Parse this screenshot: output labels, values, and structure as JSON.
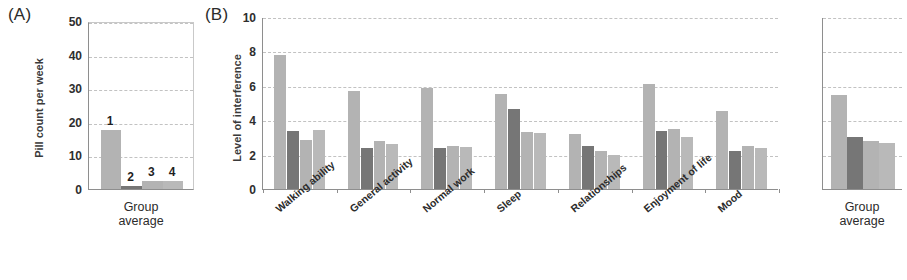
{
  "figure": {
    "panel_a_tag": "(A)",
    "panel_b_tag": "(B)"
  },
  "chart_data": [
    {
      "id": "panel_a",
      "type": "bar",
      "title": "(A)",
      "xlabel": "",
      "ylabel": "Pill count per week",
      "ylim": [
        0,
        50
      ],
      "yticks": [
        0,
        10,
        20,
        30,
        40,
        50
      ],
      "grid": true,
      "legend": "none",
      "categories": [
        "Group average"
      ],
      "bar_labels": [
        "1",
        "2",
        "3",
        "4"
      ],
      "series": [
        {
          "name": "1",
          "values": [
            17.5
          ],
          "color": "#b3b3b3"
        },
        {
          "name": "2",
          "values": [
            0.8
          ],
          "color": "#767676"
        },
        {
          "name": "3",
          "values": [
            2.3
          ],
          "color": "#b3b3b3"
        },
        {
          "name": "4",
          "values": [
            2.4
          ],
          "color": "#b9b9b9"
        }
      ]
    },
    {
      "id": "panel_b_main",
      "type": "bar",
      "title": "(B)",
      "xlabel": "",
      "ylabel": "Level of interference",
      "ylim": [
        0,
        10
      ],
      "yticks": [
        0,
        2,
        4,
        6,
        8,
        10
      ],
      "grid": true,
      "legend": "none",
      "categories": [
        "Walking ability",
        "General activity",
        "Normal work",
        "Sleep",
        "Relationships",
        "Enjoyment of life",
        "Mood"
      ],
      "series": [
        {
          "name": "1",
          "values": [
            7.8,
            5.7,
            5.85,
            5.5,
            3.2,
            6.1,
            4.55
          ],
          "color": "#b3b3b3"
        },
        {
          "name": "2",
          "values": [
            3.4,
            2.4,
            2.4,
            4.65,
            2.5,
            3.4,
            2.2
          ],
          "color": "#767676"
        },
        {
          "name": "3",
          "values": [
            2.85,
            2.8,
            2.5,
            3.3,
            2.2,
            3.5,
            2.5
          ],
          "color": "#b3b3b3"
        },
        {
          "name": "4",
          "values": [
            3.45,
            2.6,
            2.45,
            3.25,
            2.0,
            3.0,
            2.4
          ],
          "color": "#b9b9b9"
        }
      ]
    },
    {
      "id": "panel_b_group_average",
      "type": "bar",
      "title": "",
      "xlabel": "",
      "ylabel": "",
      "ylim": [
        0,
        10
      ],
      "yticks": [
        0,
        2,
        4,
        6,
        8,
        10
      ],
      "grid": true,
      "legend": "none",
      "categories": [
        "Group average"
      ],
      "series": [
        {
          "name": "1",
          "values": [
            5.45
          ],
          "color": "#b3b3b3"
        },
        {
          "name": "2",
          "values": [
            3.0
          ],
          "color": "#767676"
        },
        {
          "name": "3",
          "values": [
            2.8
          ],
          "color": "#b3b3b3"
        },
        {
          "name": "4",
          "values": [
            2.7
          ],
          "color": "#b9b9b9"
        }
      ]
    }
  ],
  "panel_a": {
    "group_axis_label": "Group\naverage"
  },
  "panel_b": {
    "group_axis_label": "Group\naverage"
  }
}
